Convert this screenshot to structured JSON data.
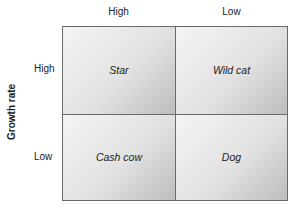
{
  "matrix": {
    "column_labels": [
      "High",
      "Low"
    ],
    "row_labels": [
      "High",
      "Low"
    ],
    "y_axis_title": "Growth rate",
    "cells": [
      {
        "label": "Star"
      },
      {
        "label": "Wild cat"
      },
      {
        "label": "Cash cow"
      },
      {
        "label": "Dog"
      }
    ]
  }
}
